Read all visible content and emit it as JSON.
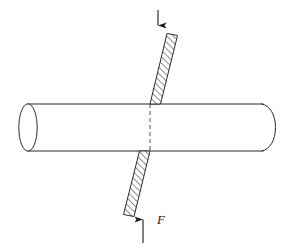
{
  "figure": {
    "background_color": "#ffffff",
    "line_color": "#2b2b2b",
    "hatch_color": "#2b2b2b",
    "label_color": "#1a1a1a",
    "labels": [
      {
        "name": "force-label-F",
        "text": "F",
        "x": 157,
        "y": 220,
        "style": "italic"
      }
    ],
    "cylinder": {
      "name": "cylinder-bar",
      "left_x": 28,
      "right_x": 275,
      "top_y": 104,
      "bottom_y": 151,
      "left_cap_rx": 9,
      "right_cap_rx": 13,
      "fill": "#ffffff"
    },
    "shear_plane_top": {
      "name": "shear-plane-upper",
      "points": "167,33 177,35 160,104 150,104",
      "hatch_angle_deg": 45,
      "hatch_spacing_px": 3.2
    },
    "shear_plane_bottom": {
      "name": "shear-plane-lower",
      "points": "150,151 140,151 124,215 134,216",
      "hatch_angle_deg": 45,
      "hatch_spacing_px": 3.2
    },
    "dashed_axis": {
      "name": "shear-plane-trace-dashed",
      "x": 150,
      "y1": 104,
      "y2": 151,
      "dash_pattern": "4,3"
    },
    "arrows": [
      {
        "name": "arrow-force-down",
        "direction": "down",
        "x": 158,
        "y_start": 10,
        "y_end": 34,
        "head_width": 5,
        "head_length": 8
      },
      {
        "name": "arrow-force-up",
        "direction": "up",
        "x": 143,
        "y_start": 243,
        "y_end": 211,
        "head_width": 5,
        "head_length": 8
      }
    ]
  }
}
